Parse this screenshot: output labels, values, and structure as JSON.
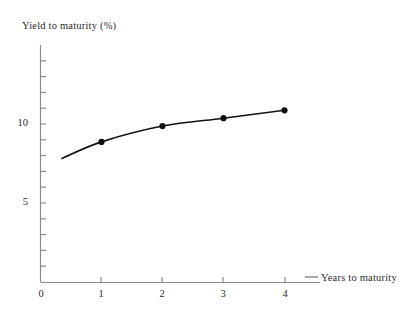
{
  "chart_data": {
    "type": "line",
    "title": "",
    "subtitle": "",
    "xlabel": "Years to maturity",
    "ylabel": "Yield to maturity (%)",
    "x": [
      1,
      2,
      3,
      4
    ],
    "values": [
      8.9,
      9.9,
      10.4,
      10.9
    ],
    "series": [
      {
        "name": "Yield curve",
        "x": [
          1,
          2,
          3,
          4
        ],
        "values": [
          8.9,
          9.9,
          10.4,
          10.9
        ]
      }
    ],
    "curve_start": {
      "x": 0.35,
      "y": 7.85
    },
    "curve_end": {
      "x": 4.0,
      "y": 10.9
    },
    "xlim": [
      0,
      4.6
    ],
    "ylim": [
      0,
      15
    ],
    "x_ticks": [
      0,
      1,
      2,
      3,
      4
    ],
    "x_tick_labels": [
      "0",
      "1",
      "2",
      "3",
      "4"
    ],
    "y_ticks": [
      1,
      2,
      3,
      4,
      5,
      6,
      7,
      8,
      9,
      10,
      11,
      12,
      13,
      14
    ],
    "y_tick_labels_shown": [
      {
        "value": 5,
        "label": "5"
      },
      {
        "value": 10,
        "label": "10"
      }
    ],
    "origin_label": "0",
    "grid": false,
    "legend": "none",
    "marker": "filled-circle",
    "colors": {
      "axis": "#8a8a8a",
      "curve": "#111111",
      "marker": "#111111",
      "text": "#2b2b2b",
      "background": "#ffffff"
    }
  },
  "axes": {
    "y_title": "Yield to maturity (%)",
    "x_title": "Years to maturity"
  },
  "labels": {
    "y_10": "10",
    "y_5": "5",
    "x_0": "0",
    "x_1": "1",
    "x_2": "2",
    "x_3": "3",
    "x_4": "4"
  }
}
